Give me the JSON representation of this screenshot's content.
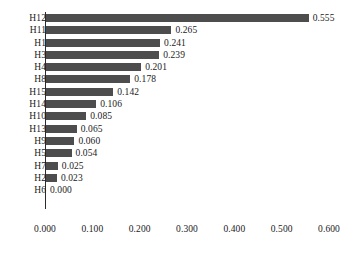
{
  "chart_data": {
    "type": "bar",
    "orientation": "horizontal",
    "title": "",
    "subtitle": "",
    "xlabel": "",
    "ylabel": "",
    "xlim": [
      0.0,
      0.6
    ],
    "grid": false,
    "legend": null,
    "bar_color": "#4d4d4d",
    "axis_color": "#2b2b2b",
    "text_color": "#1a1a1a",
    "categories": [
      "H12",
      "H11",
      "H1",
      "H3",
      "H4",
      "H8",
      "H15",
      "H14",
      "H10",
      "H13",
      "H9",
      "H5",
      "H7",
      "H2",
      "H6"
    ],
    "values": [
      0.555,
      0.265,
      0.241,
      0.239,
      0.201,
      0.178,
      0.142,
      0.106,
      0.085,
      0.065,
      0.06,
      0.054,
      0.025,
      0.023,
      0.0
    ],
    "value_labels": [
      "0.555",
      "0.265",
      "0.241",
      "0.239",
      "0.201",
      "0.178",
      "0.142",
      "0.106",
      "0.085",
      "0.065",
      "0.060",
      "0.054",
      "0.025",
      "0.023",
      "0.000"
    ],
    "xticks": [
      0.0,
      0.1,
      0.2,
      0.3,
      0.4,
      0.5,
      0.6
    ],
    "xtick_labels": [
      "0.000",
      "0.100",
      "0.200",
      "0.300",
      "0.400",
      "0.500",
      "0.600"
    ],
    "bars": [
      {
        "category": "H12",
        "value": 0.555,
        "label": "0.555"
      },
      {
        "category": "H11",
        "value": 0.265,
        "label": "0.265"
      },
      {
        "category": "H1",
        "value": 0.241,
        "label": "0.241"
      },
      {
        "category": "H3",
        "value": 0.239,
        "label": "0.239"
      },
      {
        "category": "H4",
        "value": 0.201,
        "label": "0.201"
      },
      {
        "category": "H8",
        "value": 0.178,
        "label": "0.178"
      },
      {
        "category": "H15",
        "value": 0.142,
        "label": "0.142"
      },
      {
        "category": "H14",
        "value": 0.106,
        "label": "0.106"
      },
      {
        "category": "H10",
        "value": 0.085,
        "label": "0.085"
      },
      {
        "category": "H13",
        "value": 0.065,
        "label": "0.065"
      },
      {
        "category": "H9",
        "value": 0.06,
        "label": "0.060"
      },
      {
        "category": "H5",
        "value": 0.054,
        "label": "0.054"
      },
      {
        "category": "H7",
        "value": 0.025,
        "label": "0.025"
      },
      {
        "category": "H2",
        "value": 0.023,
        "label": "0.023"
      },
      {
        "category": "H6",
        "value": 0.0,
        "label": "0.000"
      }
    ]
  }
}
